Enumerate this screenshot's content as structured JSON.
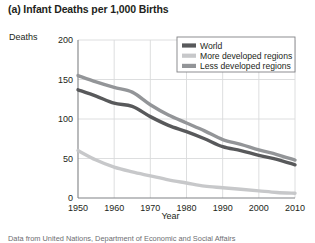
{
  "figure": {
    "title": "(a) Infant Deaths per 1,000 Births",
    "source_note": "Data from United Nations, Department of Economic and Social Affairs"
  },
  "chart_data": {
    "type": "line",
    "title": "(a) Infant Deaths per 1,000 Births",
    "xlabel": "Year",
    "ylabel": "Deaths",
    "xlim": [
      1950,
      2010
    ],
    "ylim": [
      0,
      200
    ],
    "xticks": [
      1950,
      1960,
      1970,
      1980,
      1990,
      2000,
      2010
    ],
    "yticks": [
      0,
      50,
      100,
      150,
      200
    ],
    "grid": true,
    "legend_position": "top-right",
    "x": [
      1950,
      1955,
      1960,
      1965,
      1970,
      1975,
      1980,
      1985,
      1990,
      1995,
      2000,
      2005,
      2010
    ],
    "series": [
      {
        "name": "World",
        "color": "#58595b",
        "values": [
          137,
          129,
          120,
          116,
          103,
          92,
          84,
          75,
          65,
          60,
          54,
          49,
          42
        ]
      },
      {
        "name": "More developed regions",
        "color": "#c7c8ca",
        "values": [
          60,
          48,
          39,
          33,
          28,
          23,
          19,
          15,
          13,
          11,
          9,
          7,
          6
        ]
      },
      {
        "name": "Less developed regions",
        "color": "#939598",
        "values": [
          155,
          147,
          140,
          134,
          118,
          105,
          95,
          85,
          74,
          68,
          61,
          55,
          48
        ]
      }
    ]
  },
  "legend": {
    "entries": [
      {
        "label": "World",
        "color": "#58595b"
      },
      {
        "label": "More developed regions",
        "color": "#c7c8ca"
      },
      {
        "label": "Less developed regions",
        "color": "#939598"
      }
    ]
  }
}
